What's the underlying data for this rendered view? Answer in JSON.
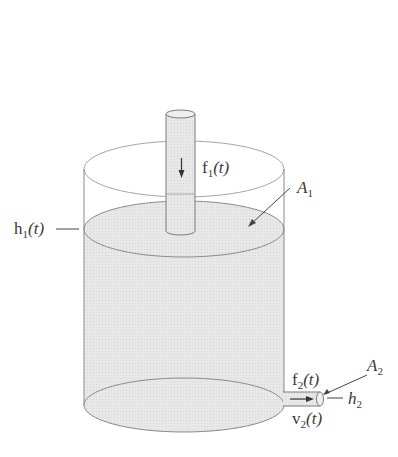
{
  "diagram": {
    "type": "tank-flow-schematic",
    "colors": {
      "background": "#ffffff",
      "liquid": "#e6e6e6",
      "outline": "#7a7a7a",
      "text": "#3a3a3a"
    },
    "labels": {
      "inflow": {
        "base": "f",
        "sub": "1",
        "suffix": "(t)"
      },
      "area_tank": {
        "base": "A",
        "sub": "1"
      },
      "level": {
        "base": "h",
        "sub": "1",
        "suffix": "(t)"
      },
      "outflow": {
        "base": "f",
        "sub": "2",
        "suffix": "(t)"
      },
      "area_outlet": {
        "base": "A",
        "sub": "2"
      },
      "outlet_height": {
        "base": "h",
        "sub": "2"
      },
      "outlet_velocity": {
        "base": "v",
        "sub": "2",
        "suffix": "(t)"
      }
    }
  }
}
